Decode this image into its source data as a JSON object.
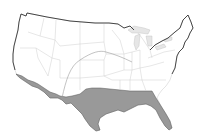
{
  "map": {
    "subject": "Contiguous United States",
    "shaded_region": {
      "label": "Southern zone",
      "states_covered": [
        "California (southern)",
        "Arizona (southern)",
        "New Mexico (southern)",
        "Texas",
        "Louisiana",
        "Mississippi (southern)",
        "Alabama (southern)",
        "Georgia (southern)",
        "Florida"
      ],
      "color": "#999999"
    },
    "boundary_line": {
      "description": "Curved line arcing across central states (Colorado/Kansas/Missouri)",
      "color": "#9a9a9a"
    },
    "colors": {
      "background": "#ffffff",
      "land": "#ffffff",
      "state_borders": "#c8c8c8",
      "coastline": "#333333",
      "great_lakes": "#e6e6e6"
    }
  }
}
